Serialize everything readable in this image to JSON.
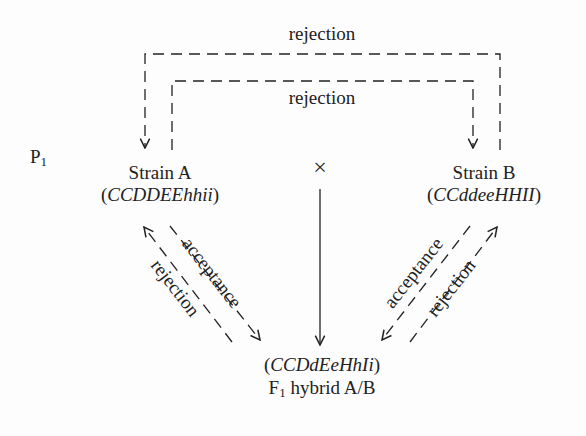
{
  "diagram": {
    "generation_label": {
      "text": "P",
      "sub": "1"
    },
    "cross_symbol": "×",
    "strain_a": {
      "name": "Strain A",
      "genotype_open": "(",
      "genotype": "CCDDEEhhii",
      "genotype_close": ")"
    },
    "strain_b": {
      "name": "Strain B",
      "genotype_open": "(",
      "genotype": "CCddeeHHII",
      "genotype_close": ")"
    },
    "hybrid": {
      "genotype_open": "(",
      "genotype": "CCDdEeHhIi",
      "genotype_close": ")",
      "label_prefix": "F",
      "label_sub": "1",
      "label_suffix": " hybrid A/B"
    },
    "arrows": {
      "outer_top": "rejection",
      "inner_top": "rejection",
      "left_down": "acceptance",
      "left_up": "rejection",
      "right_down": "acceptance",
      "right_up": "rejection"
    },
    "colors": {
      "ink": "#222222",
      "background": "#fdfdfd"
    }
  }
}
